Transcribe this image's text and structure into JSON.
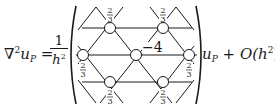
{
  "equation": {
    "lhs": {
      "operator": "∇",
      "operator_power": "2",
      "variable": "u",
      "subscript": "P",
      "equals": "="
    },
    "prefactor": {
      "numerator": "1",
      "denominator": "h",
      "denominator_power": "2"
    },
    "rhs": {
      "variable": "u",
      "subscript": "P",
      "plus": "+",
      "error_term": "O(h",
      "error_power": "2",
      "error_close": ")"
    }
  },
  "stencil": {
    "type": "hexagonal",
    "center_weight": "−4",
    "neighbor_weight_num": "2",
    "neighbor_weight_den": "3",
    "nodes": [
      {
        "id": "center",
        "x": 136,
        "y": 55,
        "weight": "−4"
      },
      {
        "id": "top-left",
        "x": 110,
        "y": 28,
        "weight": "2/3"
      },
      {
        "id": "top-right",
        "x": 163,
        "y": 28,
        "weight": "2/3"
      },
      {
        "id": "left",
        "x": 83,
        "y": 55,
        "weight": "2/3"
      },
      {
        "id": "right",
        "x": 189,
        "y": 55,
        "weight": "2/3"
      },
      {
        "id": "bottom-left",
        "x": 110,
        "y": 82,
        "weight": "2/3"
      },
      {
        "id": "bottom-right",
        "x": 163,
        "y": 82,
        "weight": "2/3"
      }
    ]
  }
}
